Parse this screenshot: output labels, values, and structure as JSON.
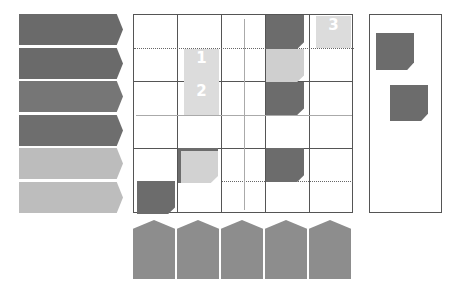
{
  "colors": {
    "dark": "#6a6a6a",
    "medium": "#7d7d7d",
    "light": "#bdbdbd",
    "tile_light": "#dcdcdc",
    "house": "#8d8d8d"
  },
  "left_arrows": [
    {
      "top": 14,
      "color": "#6a6a6a"
    },
    {
      "top": 48,
      "color": "#6a6a6a"
    },
    {
      "top": 81,
      "color": "#767676"
    },
    {
      "top": 115,
      "color": "#6e6e6e"
    },
    {
      "top": 148,
      "color": "#bcbcbc"
    },
    {
      "top": 182,
      "color": "#bdbdbd"
    }
  ],
  "board": {
    "columns": 5,
    "rows": 6,
    "numbered_tiles": [
      {
        "label": "1",
        "col": 1,
        "row": 1
      },
      {
        "label": "2",
        "col": 1,
        "row": 2
      },
      {
        "label": "3",
        "col": 4,
        "row": 0
      }
    ]
  },
  "side_panel": {
    "tiles": 2
  },
  "bottom_houses": {
    "count": 5
  }
}
